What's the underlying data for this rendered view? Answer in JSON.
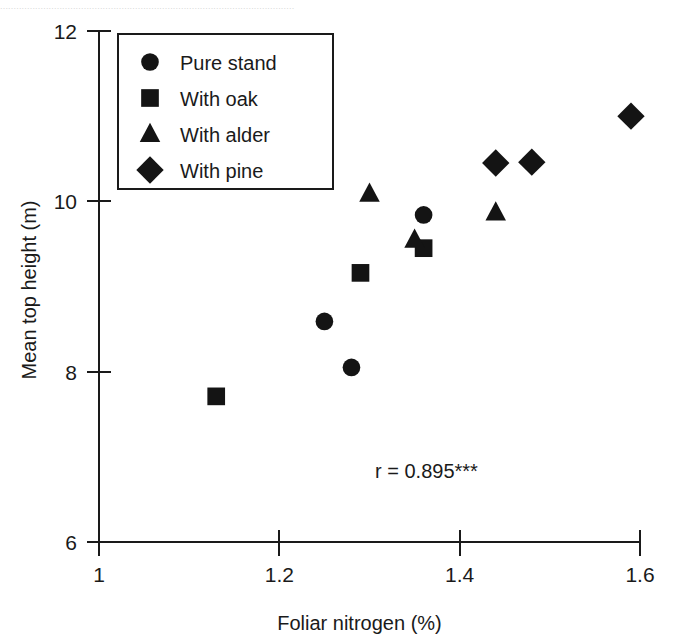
{
  "scan": {
    "bleed_text": "............................................................................................................."
  },
  "chart_data": {
    "type": "scatter",
    "title": "",
    "xlabel": "Foliar nitrogen (%)",
    "ylabel": "Mean top height (m)",
    "xlim": [
      1.0,
      1.6
    ],
    "ylim": [
      6,
      12
    ],
    "xticks": [
      1,
      1.2,
      1.4,
      1.6
    ],
    "xtick_labels": [
      "1",
      "1.2",
      "1.4",
      "1.6"
    ],
    "yticks": [
      6,
      8,
      10,
      12
    ],
    "ytick_labels": [
      "6",
      "8",
      "10",
      "12"
    ],
    "grid": false,
    "legend_position": "top-left",
    "annotation": "r = 0.895***",
    "series": [
      {
        "name": "Pure stand",
        "marker": "circle",
        "color": "#141414",
        "points": [
          {
            "x": 1.25,
            "y": 8.59
          },
          {
            "x": 1.28,
            "y": 8.05
          },
          {
            "x": 1.36,
            "y": 9.84
          }
        ]
      },
      {
        "name": "With oak",
        "marker": "square",
        "color": "#141414",
        "points": [
          {
            "x": 1.13,
            "y": 7.71
          },
          {
            "x": 1.29,
            "y": 9.16
          },
          {
            "x": 1.36,
            "y": 9.45
          }
        ]
      },
      {
        "name": "With alder",
        "marker": "triangle",
        "color": "#141414",
        "points": [
          {
            "x": 1.3,
            "y": 10.09
          },
          {
            "x": 1.35,
            "y": 9.55
          },
          {
            "x": 1.44,
            "y": 9.87
          }
        ]
      },
      {
        "name": "With pine",
        "marker": "diamond",
        "color": "#141414",
        "points": [
          {
            "x": 1.44,
            "y": 10.45
          },
          {
            "x": 1.48,
            "y": 10.46
          },
          {
            "x": 1.59,
            "y": 11.0
          }
        ]
      }
    ]
  },
  "legend": {
    "entries": [
      {
        "label": "Pure stand",
        "marker": "circle"
      },
      {
        "label": "With oak",
        "marker": "square"
      },
      {
        "label": "With alder",
        "marker": "triangle"
      },
      {
        "label": "With pine",
        "marker": "diamond"
      }
    ]
  }
}
